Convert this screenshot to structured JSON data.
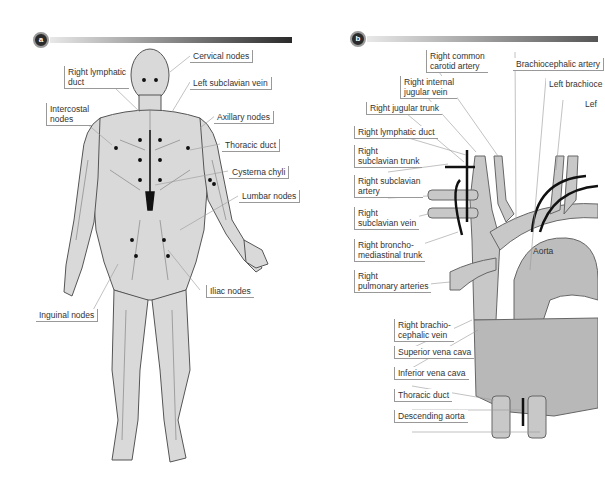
{
  "panel_a": {
    "badge": "a",
    "labels": {
      "cervical_nodes": "Cervical nodes",
      "right_lymphatic_duct": "Right lymphatic\nduct",
      "left_subclavian_vein": "Left subclavian vein",
      "intercostal_nodes": "Intercostal\nnodes",
      "axillary_nodes": "Axillary nodes",
      "thoracic_duct": "Thoracic duct",
      "cisterna_chyli": "Cysterna chyli",
      "lumbar_nodes": "Lumbar nodes",
      "iliac_nodes": "Iliac nodes",
      "inguinal_nodes": "Inguinal nodes"
    }
  },
  "panel_b": {
    "badge": "b",
    "labels": {
      "right_common_carotid_artery": "Right common\ncarotid artery",
      "brachiocephalic_artery": "Brachiocephalic artery",
      "right_internal_jugular_vein": "Right internal\njugular vein",
      "left_brachiocephalic": "Left brachioce",
      "left_cut": "Lef",
      "right_jugular_trunk": "Right jugular trunk",
      "right_lymphatic_duct": "Right lymphatic duct",
      "right_subclavian_trunk": "Right\nsubclavian trunk",
      "right_subclavian_artery": "Right subclavian\nartery",
      "right_subclavian_vein": "Right\nsubclavian vein",
      "right_bronchomediastinal_trunk": "Right broncho-\nmediastinal trunk",
      "right_pulmonary_arteries": "Right\npulmonary arteries",
      "aorta": "Aorta",
      "right_brachiocephalic_vein": "Right brachio-\ncephalic vein",
      "superior_vena_cava": "Superior vena cava",
      "inferior_vena_cava": "Inferior vena cava",
      "thoracic_duct": "Thoracic duct",
      "descending_aorta": "Descending aorta"
    }
  },
  "colors": {
    "body_fill": "#d9d9d9",
    "outline": "#555555",
    "vessel_fill": "#c4c4c4",
    "duct": "#111111"
  }
}
